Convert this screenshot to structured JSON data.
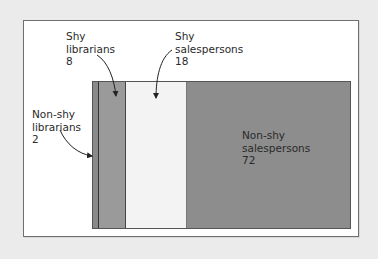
{
  "diagram": {
    "type": "area-proportion",
    "segments": [
      {
        "id": "non-shy-librarians",
        "line1": "Non-shy",
        "line2": "librarians",
        "value": "2",
        "color": "#8a8a8a"
      },
      {
        "id": "shy-librarians",
        "line1": "Shy",
        "line2": "librarians",
        "value": "8",
        "color": "#9a9a9a"
      },
      {
        "id": "shy-salespersons",
        "line1": "Shy",
        "line2": "salespersons",
        "value": "18",
        "color": "#f3f3f3"
      },
      {
        "id": "non-shy-salespersons",
        "line1": "Non-shy",
        "line2": "salespersons",
        "value": "72",
        "color": "#8d8d8d"
      }
    ]
  }
}
